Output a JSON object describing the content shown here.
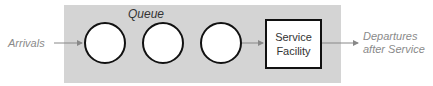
{
  "diagram": {
    "input_label": "Arrivals",
    "queue_label": "Queue",
    "queue_slots": 3,
    "service_label_line1": "Service",
    "service_label_line2": "Facility",
    "output_label_line1": "Departures",
    "output_label_line2": "after Service",
    "colors": {
      "panel": "#d4d4d4",
      "arrow": "#888888",
      "outline": "#111111",
      "side_text": "#8a8a8a"
    }
  }
}
